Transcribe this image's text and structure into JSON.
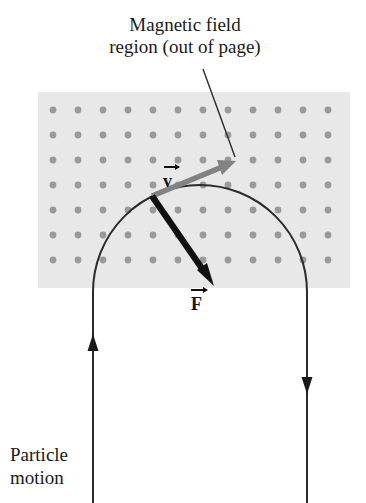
{
  "figure": {
    "width": 366,
    "height": 503,
    "background": "#ffffff"
  },
  "captions": {
    "field_region": "Magnetic field\nregion (out of page)",
    "particle_motion": "Particle\nmotion"
  },
  "labels": {
    "velocity": "v",
    "force": "F"
  },
  "field_region": {
    "label": "magnetic field region",
    "fill": "#e8e8e8",
    "x": 38,
    "y": 92,
    "width": 312,
    "height": 196,
    "dot_color": "#9a9a9a",
    "dot_radius": 3.4,
    "dot_spacing_x": 25,
    "dot_spacing_y": 25,
    "dot_origin_x": 53,
    "dot_origin_y": 110,
    "dot_columns": 12,
    "dot_rows": 8,
    "symbol_meaning": "field out of page"
  },
  "trajectory": {
    "label": "particle path",
    "stroke": "#2b2b2b",
    "stroke_width": 2,
    "left_line_x": 93,
    "right_line_x": 307,
    "bottom_y": 503,
    "arc_top_y": 186,
    "arc_center_x": 200,
    "arc_center_y": 292,
    "arc_radius": 107
  },
  "direction_arrows": [
    {
      "name": "incoming-arrow",
      "x": 93,
      "y": 348,
      "direction": "up",
      "color": "#1a1a1a"
    },
    {
      "name": "outgoing-arrow",
      "x": 307,
      "y": 380,
      "direction": "down",
      "color": "#1a1a1a"
    }
  ],
  "vectors": [
    {
      "name": "velocity-vector",
      "symbol": "v",
      "color": "#808080",
      "origin_x": 152,
      "origin_y": 196,
      "tip_x": 232,
      "tip_y": 163,
      "width": 5.5,
      "meaning": "tangent to path"
    },
    {
      "name": "force-vector",
      "symbol": "F",
      "color": "#111111",
      "origin_x": 152,
      "origin_y": 196,
      "tip_x": 212,
      "tip_y": 282,
      "width": 6.5,
      "meaning": "centripetal, toward center"
    }
  ],
  "leader_line": {
    "name": "caption-leader-line",
    "x1": 203,
    "y1": 69,
    "x2": 235,
    "y2": 157,
    "color": "#2b2b2b",
    "width": 1.4
  }
}
